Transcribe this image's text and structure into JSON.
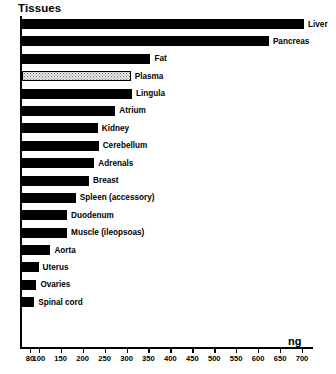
{
  "chart_data": {
    "type": "bar",
    "orientation": "horizontal",
    "title": "Tissues",
    "xlabel": "ng",
    "ylabel": "",
    "xlim": [
      80,
      700
    ],
    "grid": false,
    "legend": null,
    "tick_labels": [
      "80",
      "100",
      "150",
      "200",
      "250",
      "300",
      "350",
      "400",
      "450",
      "500",
      "550",
      "600",
      "650",
      "700"
    ],
    "ticks": [
      80,
      100,
      150,
      200,
      250,
      300,
      350,
      400,
      450,
      500,
      550,
      600,
      650,
      700
    ],
    "categories": [
      "Liver",
      "Pancreas",
      "Fat",
      "Plasma",
      "Lingula",
      "Atrium",
      "Kidney",
      "Cerebellum",
      "Adrenals",
      "Breast",
      "Spleen (accessory)",
      "Duodenum",
      "Muscle (ileopsoas)",
      "Aorta",
      "Uterus",
      "Ovaries",
      "Spinal cord"
    ],
    "values": [
      700,
      620,
      350,
      305,
      308,
      270,
      230,
      232,
      222,
      210,
      180,
      160,
      160,
      122,
      95,
      90,
      85
    ],
    "bars": [
      {
        "label": "Liver",
        "value": 700,
        "fill": "solid"
      },
      {
        "label": "Pancreas",
        "value": 620,
        "fill": "solid"
      },
      {
        "label": "Fat",
        "value": 350,
        "fill": "solid"
      },
      {
        "label": "Plasma",
        "value": 305,
        "fill": "stipple"
      },
      {
        "label": "Lingula",
        "value": 308,
        "fill": "solid"
      },
      {
        "label": "Atrium",
        "value": 270,
        "fill": "solid"
      },
      {
        "label": "Kidney",
        "value": 230,
        "fill": "solid"
      },
      {
        "label": "Cerebellum",
        "value": 232,
        "fill": "solid"
      },
      {
        "label": "Adrenals",
        "value": 222,
        "fill": "solid"
      },
      {
        "label": "Breast",
        "value": 210,
        "fill": "solid"
      },
      {
        "label": "Spleen (accessory)",
        "value": 180,
        "fill": "solid"
      },
      {
        "label": "Duodenum",
        "value": 160,
        "fill": "solid"
      },
      {
        "label": "Muscle (ileopsoas)",
        "value": 160,
        "fill": "solid"
      },
      {
        "label": "Aorta",
        "value": 122,
        "fill": "solid"
      },
      {
        "label": "Uterus",
        "value": 95,
        "fill": "solid"
      },
      {
        "label": "Ovaries",
        "value": 90,
        "fill": "solid"
      },
      {
        "label": "Spinal cord",
        "value": 85,
        "fill": "solid"
      }
    ],
    "colors": {
      "bar_solid": "#000000",
      "bar_stipple_fill": "#e9e9e9",
      "bar_stipple_border": "#000000",
      "axis": "#000000",
      "text": "#000000",
      "background": "#ffffff"
    }
  }
}
